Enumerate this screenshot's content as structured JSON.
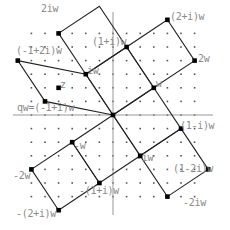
{
  "diagram": {
    "type": "gaussian-integer-lattice",
    "origin_px": [
      113,
      115
    ],
    "unit_px": 13.6,
    "grid_range": [
      -6,
      6
    ],
    "axes": {
      "x_range_px": [
        13,
        213
      ],
      "y_range_px": [
        12,
        215
      ]
    },
    "colors": {
      "axis": "#999999",
      "line": "#222222",
      "point": "#000000",
      "dot": "#555555",
      "label": "#8a8a8a"
    },
    "w": [
      3,
      2
    ],
    "squares": [
      [
        [
          0,
          0
        ],
        [
          -2,
          3
        ],
        [
          1,
          5
        ],
        [
          3,
          2
        ]
      ],
      [
        [
          3,
          2
        ],
        [
          1,
          5
        ],
        [
          4,
          7
        ],
        [
          6,
          4
        ]
      ],
      [
        [
          -2,
          3
        ],
        [
          -4,
          6
        ],
        [
          -1,
          8
        ],
        [
          1,
          5
        ]
      ],
      [
        [
          0,
          0
        ],
        [
          -2,
          3
        ],
        [
          -7,
          4
        ],
        [
          -5,
          1
        ]
      ],
      [
        [
          0,
          0
        ],
        [
          2,
          -3
        ],
        [
          -1,
          -5
        ],
        [
          -3,
          -2
        ]
      ],
      [
        [
          -3,
          -2
        ],
        [
          -1,
          -5
        ],
        [
          -4,
          -7
        ],
        [
          -6,
          -4
        ]
      ],
      [
        [
          0,
          0
        ],
        [
          3,
          2
        ],
        [
          5,
          -1
        ],
        [
          2,
          -3
        ]
      ],
      [
        [
          2,
          -3
        ],
        [
          5,
          -1
        ],
        [
          7,
          -4
        ],
        [
          4,
          -6
        ]
      ]
    ],
    "points": [
      {
        "name": "origin",
        "pos": [
          0,
          0
        ]
      },
      {
        "name": "w",
        "pos": [
          3,
          2
        ]
      },
      {
        "name": "2w",
        "pos": [
          6,
          4
        ]
      },
      {
        "name": "iw",
        "pos": [
          -2,
          3
        ]
      },
      {
        "name": "2iw",
        "pos": [
          -4,
          6
        ]
      },
      {
        "name": "(1+i)w",
        "pos": [
          1,
          5
        ]
      },
      {
        "name": "(2+i)w",
        "pos": [
          4,
          7
        ]
      },
      {
        "name": "(-1+2i)w",
        "pos": [
          -7,
          4
        ]
      },
      {
        "name": "qw",
        "pos": [
          -5,
          1
        ]
      },
      {
        "name": "z",
        "pos": [
          -4,
          2
        ]
      },
      {
        "name": "-w",
        "pos": [
          -3,
          -2
        ]
      },
      {
        "name": "-2w",
        "pos": [
          -6,
          -4
        ]
      },
      {
        "name": "-iw",
        "pos": [
          2,
          -3
        ]
      },
      {
        "name": "-2iw",
        "pos": [
          4,
          -6
        ]
      },
      {
        "name": "(1-i)w",
        "pos": [
          5,
          -1
        ]
      },
      {
        "name": "(1-2i)w",
        "pos": [
          7,
          -4
        ]
      },
      {
        "name": "-(1+i)w",
        "pos": [
          -1,
          -5
        ]
      },
      {
        "name": "-(2+i)w",
        "pos": [
          -4,
          -7
        ]
      }
    ]
  },
  "labels": {
    "two_i_w": "2iw",
    "one_plus_i_w": "(1+i)w",
    "two_plus_i_w": "(2+i)w",
    "neg1_plus_2i_w": "(-1+2i)w",
    "i_w": "iw",
    "two_w": "2w",
    "w": "w",
    "z": "z",
    "qw": "qw=(-1+i)w",
    "neg_w": "-w",
    "one_minus_i_w": "(1-i)w",
    "neg_two_w": "-2w",
    "neg_i_w": "-iw",
    "one_minus_2i_w": "(1-2i)w",
    "neg_one_plus_i_w": "-(1+i)w",
    "neg_two_i_w": "-2iw",
    "neg_two_plus_i_w": "-(2+i)w"
  }
}
